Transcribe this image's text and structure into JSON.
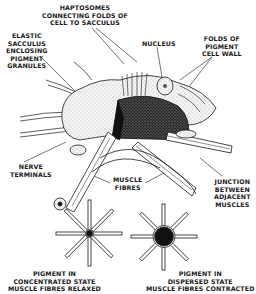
{
  "diagram": {
    "colors": {
      "ink": "#1a1a1a",
      "background": "#ffffff",
      "pigment": "#2a2a2a"
    },
    "labels": {
      "haptosomes": [
        "HAPTOSOMES",
        "CONNECTING FOLDS OF",
        "CELL TO SACCULUS"
      ],
      "elastic_sacculus": [
        "ELASTIC",
        "SACCULUS",
        "ENCLOSING",
        "PIGMENT",
        "GRANULES"
      ],
      "nucleus": [
        "NUCLEUS"
      ],
      "folds": [
        "FOLDS OF",
        "PIGMENT",
        "CELL WALL"
      ],
      "nerve_terminals": [
        "NERVE",
        "TERMINALS"
      ],
      "muscle_fibres": [
        "MUSCLE",
        "FIBRES"
      ],
      "junction": [
        "JUNCTION",
        "BETWEEN",
        "ADJACENT",
        "MUSCLES"
      ],
      "concentrated": [
        "PIGMENT IN",
        "CONCENTRATED STATE",
        "MUSCLE FIBRES RELAXED"
      ],
      "dispersed": [
        "PIGMENT IN",
        "DISPERSED STATE",
        "MUSCLE FIBRES CONTRACTED"
      ]
    },
    "small_diagrams": [
      {
        "state": "concentrated",
        "center_radius": 3,
        "spokes": 8
      },
      {
        "state": "dispersed",
        "center_radius": 9,
        "spokes": 8
      }
    ]
  }
}
